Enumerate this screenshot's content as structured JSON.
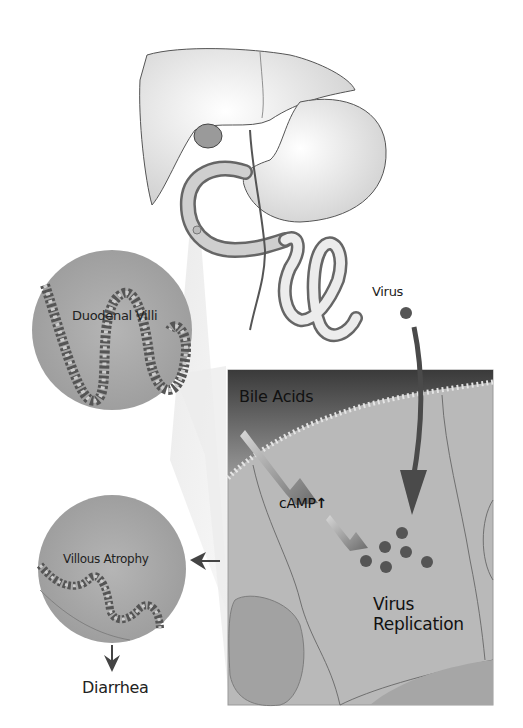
{
  "diagram": {
    "organs": {
      "name": "liver-stomach-duodenum-illustration"
    },
    "labels": {
      "virus": "Virus",
      "duodenal_villi": "Duodenal Villi",
      "bile_acids": "Bile Acids",
      "camp": "cAMP",
      "camp_arrow": "↑",
      "virus_replication_line1": "Virus",
      "virus_replication_line2": "Replication",
      "villous_atrophy": "Villous Atrophy",
      "diarrhea": "Diarrhea"
    },
    "colors": {
      "background": "#ffffff",
      "cell_fill": "#b9b9b9",
      "lumen_dark": "#3c3c3c",
      "virus_dot": "#555555",
      "circle_fill": "#a9a9a9",
      "text": "#222222"
    },
    "virus_particle_count": 6
  }
}
